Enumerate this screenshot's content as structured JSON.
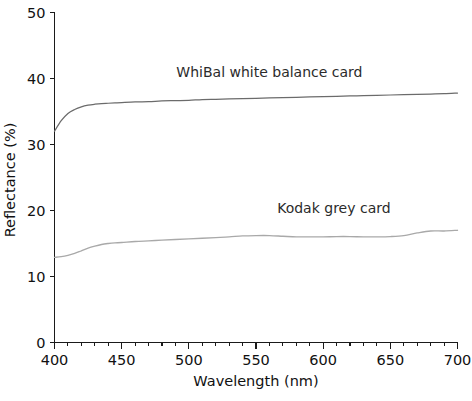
{
  "chart_data": {
    "type": "line",
    "title": "",
    "xlabel": "Wavelength (nm)",
    "ylabel": "Reflectance (%)",
    "xlim": [
      400,
      700
    ],
    "ylim": [
      0,
      50
    ],
    "xticks": [
      400,
      450,
      500,
      550,
      600,
      650,
      700
    ],
    "yticks": [
      0,
      10,
      20,
      30,
      40,
      50
    ],
    "xtick_labels": [
      "400",
      "450",
      "500",
      "550",
      "600",
      "650",
      "700"
    ],
    "ytick_labels": [
      "0",
      "10",
      "20",
      "30",
      "40",
      "50"
    ],
    "x_minor_tick_step": 10,
    "grid": false,
    "legend": "inline-annotations",
    "x": [
      400,
      405,
      410,
      415,
      420,
      425,
      430,
      435,
      440,
      445,
      450,
      460,
      470,
      480,
      490,
      500,
      510,
      520,
      530,
      540,
      550,
      560,
      570,
      580,
      590,
      600,
      610,
      620,
      630,
      640,
      650,
      660,
      670,
      680,
      690,
      700
    ],
    "series": [
      {
        "name": "WhiBal white balance card",
        "color": "#6b6b6b",
        "label_x": 560,
        "label_y": 40.2,
        "values": [
          32.0,
          33.6,
          34.7,
          35.3,
          35.7,
          35.95,
          36.1,
          36.2,
          36.25,
          36.3,
          36.35,
          36.45,
          36.5,
          36.6,
          36.65,
          36.7,
          36.8,
          36.85,
          36.9,
          36.95,
          37.0,
          37.05,
          37.1,
          37.15,
          37.2,
          37.25,
          37.3,
          37.35,
          37.4,
          37.45,
          37.5,
          37.55,
          37.6,
          37.65,
          37.7,
          37.8
        ]
      },
      {
        "name": "Kodak grey card",
        "color": "#a9a9a9",
        "label_x": 608,
        "label_y": 19.6,
        "values": [
          12.9,
          13.0,
          13.2,
          13.5,
          13.9,
          14.3,
          14.6,
          14.85,
          15.0,
          15.1,
          15.15,
          15.3,
          15.4,
          15.5,
          15.6,
          15.7,
          15.8,
          15.9,
          16.0,
          16.15,
          16.2,
          16.2,
          16.1,
          16.0,
          16.0,
          16.0,
          16.05,
          16.05,
          16.0,
          16.0,
          16.05,
          16.2,
          16.6,
          16.9,
          16.9,
          17.0
        ]
      }
    ]
  },
  "annotations": {
    "whibal_label": "WhiBal white balance card",
    "kodak_label": "Kodak grey card"
  }
}
